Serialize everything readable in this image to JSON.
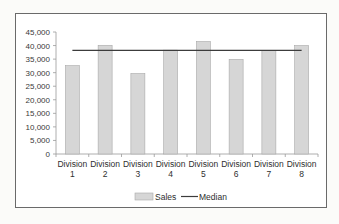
{
  "chart_data": {
    "type": "bar",
    "title": "",
    "xlabel": "",
    "ylabel": "",
    "categories": [
      "Division 1",
      "Division 2",
      "Division 3",
      "Division 4",
      "Division 5",
      "Division 6",
      "Division 7",
      "Division 8"
    ],
    "category_lines": [
      [
        "Division",
        "1"
      ],
      [
        "Division",
        "2"
      ],
      [
        "Division",
        "3"
      ],
      [
        "Division",
        "4"
      ],
      [
        "Division",
        "5"
      ],
      [
        "Division",
        "6"
      ],
      [
        "Division",
        "7"
      ],
      [
        "Division",
        "8"
      ]
    ],
    "series": [
      {
        "name": "Sales",
        "type": "bar",
        "color": "#d6d6d6",
        "values": [
          32600,
          40100,
          29700,
          38300,
          41500,
          34900,
          38200,
          40000
        ]
      },
      {
        "name": "Median",
        "type": "line",
        "color": "#3c3c3c",
        "values": [
          38250,
          38250,
          38250,
          38250,
          38250,
          38250,
          38250,
          38250
        ]
      }
    ],
    "ylim": [
      0,
      45000
    ],
    "yticks": [
      0,
      5000,
      10000,
      15000,
      20000,
      25000,
      30000,
      35000,
      40000,
      45000
    ],
    "ytick_labels": [
      "0",
      "5,000",
      "10,000",
      "15,000",
      "20,000",
      "25,000",
      "30,000",
      "35,000",
      "40,000",
      "45,000"
    ],
    "grid": false,
    "legend_position": "bottom"
  },
  "legend": {
    "sales_label": "Sales",
    "median_label": "Median"
  },
  "colors": {
    "bar_fill": "#d6d6d6",
    "bar_stroke": "#a8a8a8",
    "median_line": "#3c3c3c",
    "axis": "#9a9a9a",
    "frame": "#6a6a6a"
  }
}
